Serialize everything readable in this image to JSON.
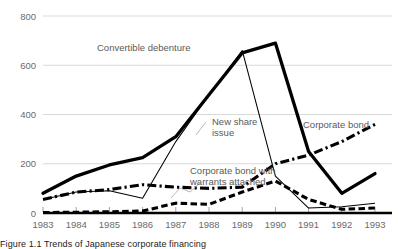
{
  "chart_data": {
    "type": "line",
    "title": "",
    "xlabel": "",
    "ylabel": "",
    "categories": [
      "1983",
      "1984",
      "1985",
      "1986",
      "1987",
      "1988",
      "1989",
      "1990",
      "1991",
      "1992",
      "1993"
    ],
    "xlim": [
      1983,
      1993
    ],
    "ylim": [
      0,
      800
    ],
    "yticks": [
      0,
      200,
      400,
      600,
      800
    ],
    "grid": true,
    "legend_position": "inline-annotations",
    "series": [
      {
        "name": "Convertible debenture",
        "style": "thick-solid",
        "color": "#000000",
        "values": [
          80,
          150,
          195,
          225,
          310,
          480,
          650,
          690,
          250,
          80,
          160
        ]
      },
      {
        "name": "New share issue",
        "style": "thin-solid",
        "color": "#000000",
        "values": [
          55,
          85,
          90,
          60,
          290,
          480,
          660,
          150,
          20,
          25,
          40
        ]
      },
      {
        "name": "Corporate bond",
        "style": "dash-dot",
        "color": "#000000",
        "values": [
          55,
          85,
          95,
          115,
          105,
          100,
          105,
          200,
          235,
          290,
          360
        ]
      },
      {
        "name": "Corporate bond with warrants attached",
        "style": "dashed",
        "color": "#000000",
        "values": [
          2,
          3,
          5,
          8,
          40,
          35,
          85,
          130,
          55,
          15,
          20
        ]
      }
    ],
    "annotations": [
      {
        "name": "convertible-debenture-label",
        "text": "Convertible debenture"
      },
      {
        "name": "new-share-issue-label",
        "text": "New share"
      },
      {
        "name": "new-share-issue-label-line2",
        "text": "issue"
      },
      {
        "name": "corporate-bond-label",
        "text": "Corporate bond"
      },
      {
        "name": "warrants-label-line1",
        "text": "Corporate bond with"
      },
      {
        "name": "warrants-label-line2",
        "text": "warrants attached"
      }
    ]
  },
  "axis": {
    "y_ticks": [
      "800",
      "600",
      "400",
      "200",
      "0"
    ],
    "x_ticks": [
      "1983",
      "1984",
      "1985",
      "1986",
      "1987",
      "1988",
      "1989",
      "1990",
      "1991",
      "1992",
      "1993"
    ]
  },
  "labels": {
    "convertible_debenture": "Convertible debenture",
    "new_share_issue_1": "New share",
    "new_share_issue_2": "issue",
    "corporate_bond": "Corporate bond",
    "warrants_1": "Corporate bond with",
    "warrants_2": "warrants attached"
  },
  "caption": {
    "text": "Figure 1.1  Trends of Japanese corporate financing"
  },
  "colors": {
    "line": "#000000",
    "grid": "#cfcfcf",
    "tick_text": "#6b6b6b",
    "label_text": "#5a5a5a",
    "background": "#ffffff"
  }
}
